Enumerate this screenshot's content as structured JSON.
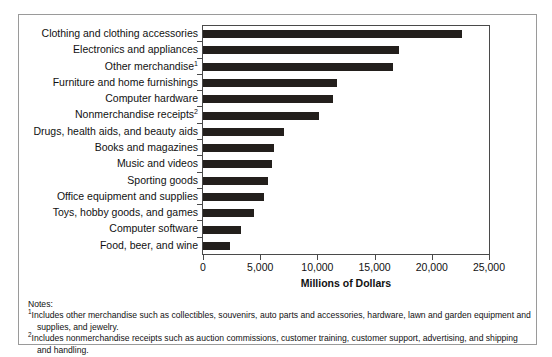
{
  "chart_data": {
    "type": "bar",
    "orientation": "horizontal",
    "title": "",
    "xlabel": "Millions of Dollars",
    "ylabel": "",
    "xlim": [
      0,
      25000
    ],
    "xticks": [
      0,
      5000,
      10000,
      15000,
      20000,
      25000
    ],
    "xtick_labels": [
      "0",
      "5,000",
      "10,000",
      "15,000",
      "20,000",
      "25,000"
    ],
    "grid": false,
    "legend": false,
    "bar_color": "#231f1c",
    "categories": [
      "Clothing and clothing accessories",
      "Electronics and appliances",
      "Other merchandise",
      "Furniture and home furnishings",
      "Computer hardware",
      "Nonmerchandise receipts",
      "Drugs, health aids, and beauty aids",
      "Books and magazines",
      "Music and videos",
      "Sporting goods",
      "Office equipment and supplies",
      "Toys, hobby goods, and games",
      "Computer software",
      "Food, beer, and wine"
    ],
    "category_footnote_markers": [
      "",
      "",
      "1",
      "",
      "",
      "2",
      "",
      "",
      "",
      "",
      "",
      "",
      "",
      ""
    ],
    "values": [
      22600,
      17100,
      16600,
      11700,
      11400,
      10100,
      7100,
      6200,
      6000,
      5700,
      5300,
      4450,
      3350,
      2350
    ]
  },
  "notes": {
    "heading": "Notes:",
    "items": [
      {
        "marker": "1",
        "text": "Includes other merchandise such as collectibles, souvenirs, auto parts and accessories, hardware, lawn and garden equipment and supplies, and jewelry."
      },
      {
        "marker": "2",
        "text": "Includes nonmerchandise receipts such as auction commissions, customer training, customer support, advertising, and shipping and handling."
      }
    ]
  }
}
